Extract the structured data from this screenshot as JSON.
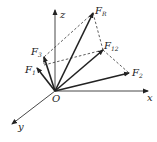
{
  "diagram": {
    "title": "",
    "origin": {
      "label": "O",
      "x": 55,
      "y": 91
    },
    "axes": [
      {
        "name": "x",
        "label": "x",
        "to": [
          148,
          91
        ],
        "label_pos": [
          147,
          101
        ]
      },
      {
        "name": "y",
        "label": "y",
        "to": [
          12,
          124
        ],
        "label_pos": [
          18,
          130
        ]
      },
      {
        "name": "z",
        "label": "z",
        "to": [
          55,
          10
        ],
        "label_pos": [
          60,
          18
        ]
      }
    ],
    "vectors": [
      {
        "name": "F_R",
        "label": "F",
        "subscript": "R",
        "to": [
          93,
          13
        ],
        "label_pos": [
          95,
          14
        ]
      },
      {
        "name": "F_12",
        "label": "F",
        "subscript": "12",
        "to": [
          103,
          50
        ],
        "label_pos": [
          104,
          49
        ]
      },
      {
        "name": "F_2",
        "label": "F",
        "subscript": "2",
        "to": [
          129,
          73
        ],
        "label_pos": [
          132,
          76
        ]
      },
      {
        "name": "F_3",
        "label": "F",
        "subscript": "3",
        "to": [
          44,
          57
        ],
        "label_pos": [
          31,
          55
        ]
      },
      {
        "name": "F_1",
        "label": "F",
        "subscript": "1",
        "to": [
          37,
          68
        ],
        "label_pos": [
          25,
          73
        ]
      }
    ],
    "dashed_edges": [
      [
        [
          93,
          13
        ],
        [
          44,
          57
        ]
      ],
      [
        [
          93,
          13
        ],
        [
          103,
          50
        ]
      ],
      [
        [
          44,
          57
        ],
        [
          44,
          65
        ]
      ],
      [
        [
          44,
          65
        ],
        [
          103,
          50
        ]
      ],
      [
        [
          103,
          50
        ],
        [
          129,
          73
        ]
      ]
    ]
  }
}
